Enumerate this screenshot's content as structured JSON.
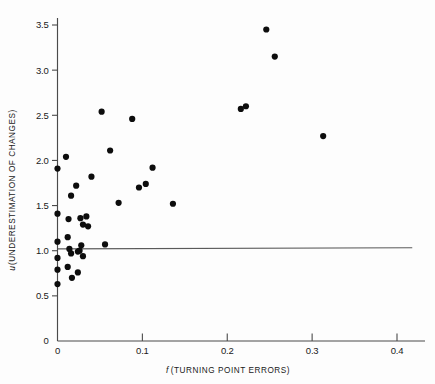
{
  "chart_data": {
    "type": "scatter",
    "title": "",
    "xlabel": "f (TURNING POINT ERRORS)",
    "xlabel_italic": "f",
    "xlabel_rest": "(TURNING  POINT  ERRORS)",
    "ylabel": "u(UNDERESTIMATION OF CHANGES)",
    "ylabel_italic": "u",
    "ylabel_rest": "(UNDERESTIMATION  OF  CHANGES)",
    "xlim": [
      0,
      0.43
    ],
    "ylim": [
      0,
      3.62
    ],
    "xticks": [
      0,
      0.1,
      0.2,
      0.3,
      0.4
    ],
    "xtick_labels": [
      "0",
      "0.1",
      "0.2",
      "0.3",
      "0.4"
    ],
    "yticks": [
      0,
      0.5,
      1.0,
      1.5,
      2.0,
      2.5,
      3.0,
      3.5
    ],
    "ytick_labels": [
      "0",
      "0.5",
      "1.0",
      "1.5",
      "2.0",
      "2.5",
      "3.0",
      "3.5"
    ],
    "grid": false,
    "legend": null,
    "marker_color": "#0d0d0d",
    "marker_size": 3.1,
    "reference_line": {
      "orientation": "horizontal",
      "y": 1.02,
      "x_start": 0.0,
      "x_end": 0.418,
      "color": "#5a5a5a"
    },
    "x": [
      0.0,
      0.0,
      0.0,
      0.0,
      0.0,
      0.0,
      0.0,
      0.006,
      0.01,
      0.01,
      0.013,
      0.014,
      0.015,
      0.016,
      0.018,
      0.019,
      0.02,
      0.022,
      0.024,
      0.025,
      0.026,
      0.028,
      0.03,
      0.032,
      0.034,
      0.036,
      0.04,
      0.042,
      0.045,
      0.048,
      0.052,
      0.056,
      0.062,
      0.066,
      0.072,
      0.08,
      0.088,
      0.096,
      0.104,
      0.112,
      0.128,
      0.136,
      0.148,
      0.152,
      0.216,
      0.222,
      0.246,
      0.256,
      0.313
    ],
    "y": [
      1.91,
      1.41,
      1.1,
      0.92,
      0.79,
      0.63,
      1.0,
      2.04,
      1.61,
      0.76,
      1.35,
      1.15,
      1.02,
      0.97,
      0.82,
      0.7,
      1.72,
      0.98,
      1.36,
      0.94,
      0.75,
      1.29,
      1.27,
      1.06,
      1.38,
      0.99,
      1.82,
      1.35,
      0.95,
      1.08,
      2.54,
      1.07,
      2.11,
      1.02,
      1.53,
      1.0,
      2.46,
      1.7,
      1.74,
      1.92,
      1.0,
      1.52,
      1.0,
      1.0,
      2.57,
      2.6,
      3.45,
      3.15,
      2.27
    ],
    "points": [
      {
        "x": 0.0,
        "y": 1.91
      },
      {
        "x": 0.0,
        "y": 1.41
      },
      {
        "x": 0.0,
        "y": 1.1
      },
      {
        "x": 0.0,
        "y": 0.92
      },
      {
        "x": 0.0,
        "y": 0.79
      },
      {
        "x": 0.0,
        "y": 0.63
      },
      {
        "x": 0.01,
        "y": 2.04
      },
      {
        "x": 0.016,
        "y": 1.61
      },
      {
        "x": 0.022,
        "y": 1.72
      },
      {
        "x": 0.013,
        "y": 1.35
      },
      {
        "x": 0.012,
        "y": 1.15
      },
      {
        "x": 0.014,
        "y": 1.02
      },
      {
        "x": 0.016,
        "y": 0.97
      },
      {
        "x": 0.012,
        "y": 0.82
      },
      {
        "x": 0.017,
        "y": 0.7
      },
      {
        "x": 0.024,
        "y": 0.76
      },
      {
        "x": 0.027,
        "y": 1.36
      },
      {
        "x": 0.03,
        "y": 1.29
      },
      {
        "x": 0.034,
        "y": 1.38
      },
      {
        "x": 0.028,
        "y": 1.06
      },
      {
        "x": 0.026,
        "y": 1.0
      },
      {
        "x": 0.03,
        "y": 0.94
      },
      {
        "x": 0.024,
        "y": 0.99
      },
      {
        "x": 0.04,
        "y": 1.82
      },
      {
        "x": 0.036,
        "y": 1.27
      },
      {
        "x": 0.052,
        "y": 2.54
      },
      {
        "x": 0.062,
        "y": 2.11
      },
      {
        "x": 0.056,
        "y": 1.07
      },
      {
        "x": 0.072,
        "y": 1.53
      },
      {
        "x": 0.088,
        "y": 2.46
      },
      {
        "x": 0.096,
        "y": 1.7
      },
      {
        "x": 0.104,
        "y": 1.74
      },
      {
        "x": 0.112,
        "y": 1.92
      },
      {
        "x": 0.136,
        "y": 1.52
      },
      {
        "x": 0.216,
        "y": 2.57
      },
      {
        "x": 0.222,
        "y": 2.6
      },
      {
        "x": 0.246,
        "y": 3.45
      },
      {
        "x": 0.256,
        "y": 3.15
      },
      {
        "x": 0.313,
        "y": 2.27
      }
    ]
  }
}
